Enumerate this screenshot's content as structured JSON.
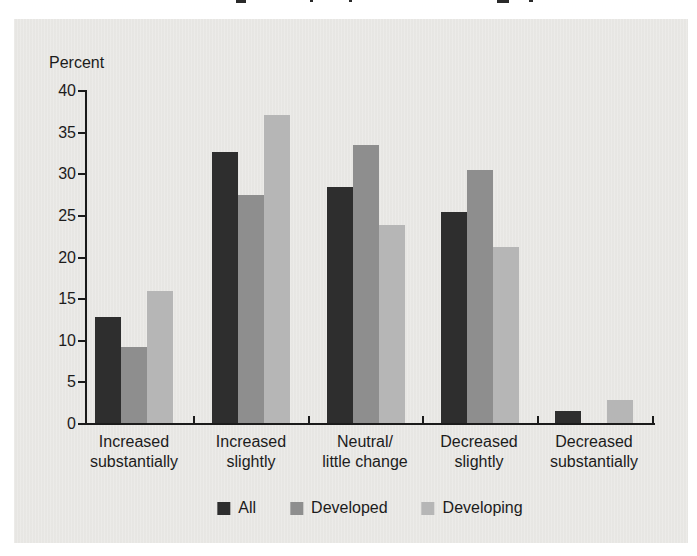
{
  "page": {
    "background": "#ffffff"
  },
  "panel": {
    "background": "#eae9e6"
  },
  "chart_data": {
    "type": "bar",
    "title": "",
    "ylabel": "Percent",
    "xlabel": "",
    "categories": [
      [
        "Increased",
        "substantially"
      ],
      [
        "Increased",
        "slightly"
      ],
      [
        "Neutral/",
        "little change"
      ],
      [
        "Decreased",
        "slightly"
      ],
      [
        "Decreased",
        "substantially"
      ]
    ],
    "series": [
      {
        "name": "All",
        "color": "#2e2e2e",
        "values": [
          12.7,
          32.5,
          28.3,
          25.4,
          1.5
        ]
      },
      {
        "name": "Developed",
        "color": "#8e8e8e",
        "values": [
          9.1,
          27.4,
          33.4,
          30.4,
          0
        ]
      },
      {
        "name": "Developing",
        "color": "#b6b6b6",
        "values": [
          15.8,
          37.0,
          23.8,
          21.2,
          2.8
        ]
      }
    ],
    "y_axis": {
      "min": 0,
      "max": 40,
      "step": 5,
      "tick_labels": [
        "0",
        "5",
        "10",
        "15",
        "20",
        "25",
        "30",
        "35",
        "40"
      ]
    },
    "legend": [
      "All",
      "Developed",
      "Developing"
    ],
    "legend_position": "bottom-center",
    "grid": false,
    "axis_color": "#1b1b1b",
    "text_color": "#1c1c1c"
  }
}
